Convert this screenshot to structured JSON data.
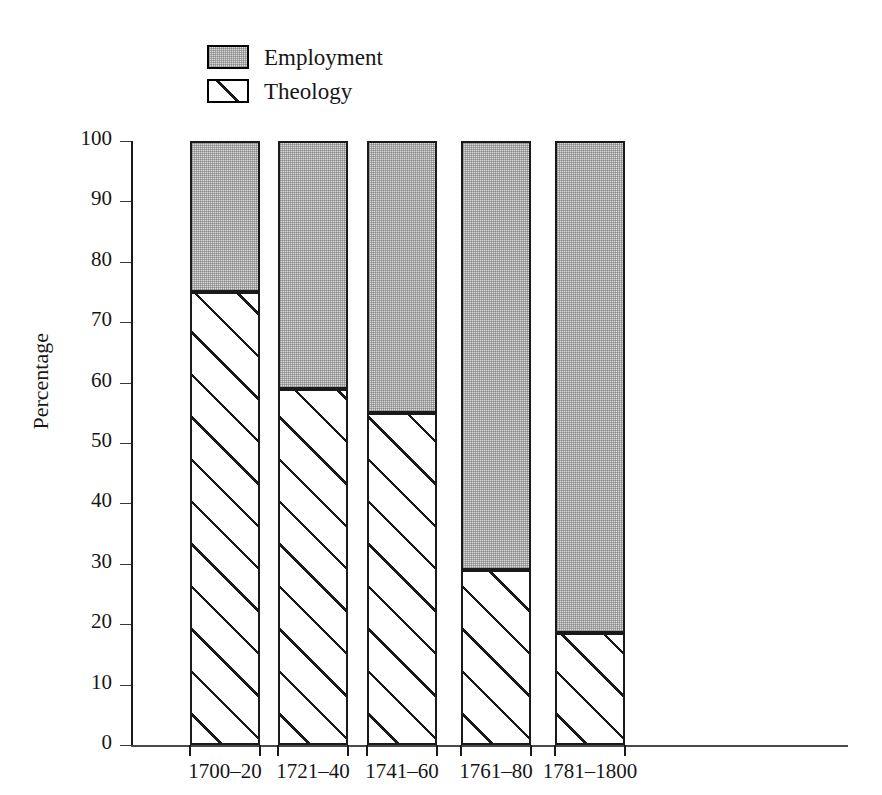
{
  "chart_data": {
    "type": "bar",
    "subtype": "stacked-100-percent",
    "title": "",
    "xlabel": "",
    "ylabel": "Percentage",
    "ylim": [
      0,
      100
    ],
    "yticks": [
      0,
      10,
      20,
      30,
      40,
      50,
      60,
      70,
      80,
      90,
      100
    ],
    "ytick_labels": [
      "0",
      "10",
      "20",
      "30",
      "40",
      "50",
      "60",
      "70",
      "80",
      "90",
      "100"
    ],
    "grid": false,
    "legend_position": "top-left",
    "categories": [
      "1700–20",
      "1721–40",
      "1741–60",
      "1761–80",
      "1781–1800"
    ],
    "series": [
      {
        "name": "Theology",
        "pattern": "diagonal-hatch",
        "color": "#ffffff",
        "values": [
          75,
          59,
          55,
          29,
          18.5
        ]
      },
      {
        "name": "Employment",
        "pattern": "stipple",
        "color": "#dcdcdc",
        "values": [
          25,
          41,
          45,
          71,
          81.5
        ]
      }
    ]
  },
  "legend": {
    "items": [
      {
        "label": "Employment",
        "pattern": "stipple"
      },
      {
        "label": "Theology",
        "pattern": "diagonal-hatch"
      }
    ]
  },
  "axes": {
    "y_title": "Percentage"
  },
  "caption": {
    "partial_text": ""
  }
}
